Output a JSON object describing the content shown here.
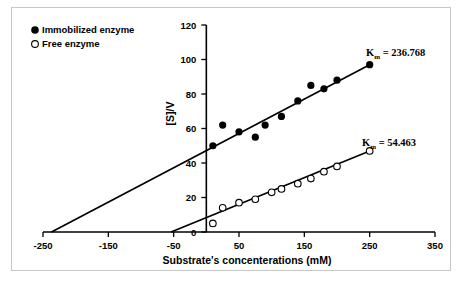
{
  "chart_data": {
    "type": "scatter",
    "title": "",
    "xlabel": "Substrate's concenterations (mM)",
    "ylabel": "[S]/V",
    "xlim": [
      -250,
      350
    ],
    "ylim": [
      0,
      120
    ],
    "xticks": [
      -250,
      -150,
      -50,
      50,
      150,
      250,
      350
    ],
    "yticks": [
      0,
      20,
      40,
      60,
      80,
      100,
      120
    ],
    "xtick_labels": [
      "-250",
      "-150",
      "-50",
      "50",
      "150",
      "250",
      "350"
    ],
    "ytick_labels": [
      "0",
      "20",
      "40",
      "60",
      "80",
      "100",
      "120"
    ],
    "grid": false,
    "legend_position": "top-left",
    "series": [
      {
        "name": "Immobilized enzyme",
        "marker": "filled-circle",
        "color": "#000000",
        "x": [
          10,
          25,
          50,
          75,
          90,
          115,
          140,
          160,
          180,
          200,
          250
        ],
        "y": [
          50,
          62,
          58,
          55,
          62,
          67,
          76,
          85,
          83,
          88,
          97
        ],
        "fit_line": {
          "x_intercept": -237,
          "x_start": -237,
          "x_end": 250,
          "y_start": 0,
          "y_end": 97
        },
        "annotation": {
          "text": "K",
          "subscript": "m",
          "value": "= 236.768",
          "full": "Km = 236.768"
        }
      },
      {
        "name": "Free enzyme",
        "marker": "open-circle",
        "color": "#000000",
        "x": [
          10,
          25,
          50,
          75,
          100,
          115,
          140,
          160,
          180,
          200,
          250
        ],
        "y": [
          5,
          14,
          17,
          19,
          23,
          25,
          28,
          31,
          35,
          38,
          47
        ],
        "fit_line": {
          "x_intercept": -54,
          "x_start": -54,
          "x_end": 250,
          "y_start": 0,
          "y_end": 47
        },
        "annotation": {
          "text": "K",
          "subscript": "m",
          "value": "= 54.463",
          "full": "Km = 54.463"
        }
      }
    ]
  },
  "legend": {
    "items": [
      {
        "label": "Immobilized enzyme",
        "marker": "filled-circle"
      },
      {
        "label": "Free enzyme",
        "marker": "open-circle"
      }
    ]
  },
  "annotations": {
    "km_immobilized_symbol": "K",
    "km_immobilized_sub": "m",
    "km_immobilized_value": "= 236.768",
    "km_free_symbol": "K",
    "km_free_sub": "m",
    "km_free_value": "= 54.463"
  },
  "colors": {
    "axis": "#000000",
    "marker": "#000000",
    "frame": "#c8c8c8",
    "background": "#ffffff"
  }
}
